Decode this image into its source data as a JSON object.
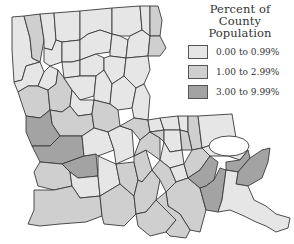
{
  "map": {
    "region": "Louisiana parishes",
    "legend": {
      "title_line1": "Percent of",
      "title_line2": "County Population",
      "items": [
        {
          "label": "0.00 to 0.99%",
          "color": "#e6e6e6"
        },
        {
          "label": "1.00 to 2.99%",
          "color": "#cfcfcf"
        },
        {
          "label": "3.00 to 9.99%",
          "color": "#a3a3a3"
        }
      ]
    }
  }
}
